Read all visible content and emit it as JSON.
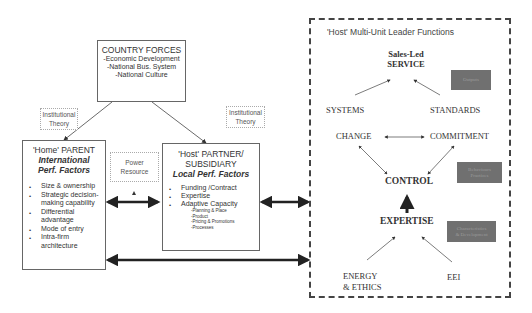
{
  "country_forces": {
    "title": "COUNTRY FORCES",
    "items": [
      "-Economic Development",
      "-National Bus. System",
      "-National Culture"
    ]
  },
  "institutional_theory_left": {
    "line1": "Institutional",
    "line2": "Theory"
  },
  "institutional_theory_right": {
    "line1": "Institutional",
    "line2": "Theory"
  },
  "power_resource": {
    "line1": "Power",
    "line2": "Resource"
  },
  "parent": {
    "title": "'Home' PARENT",
    "subtitle1": "International",
    "subtitle2": "Perf. Factors",
    "bullets": [
      "Size & ownership",
      "Strategic decision-making capability",
      "Differential advantage",
      "Mode of entry",
      "Intra-firm architecture"
    ]
  },
  "partner": {
    "title1": "'Host' PARTNER/",
    "title2": "SUBSIDIARY",
    "subtitle": "Local Perf. Factors",
    "bullets": [
      "Funding /Contract",
      "Expertise",
      "Adaptive Capacity"
    ],
    "sub_items": [
      "-Planning & Place",
      "-Product",
      "-Pricing & Promotions",
      "-Processes"
    ]
  },
  "host_functions": {
    "title": "'Host' Multi-Unit Leader Functions",
    "service_line1": "Sales-Led",
    "service_line2": "SERVICE",
    "systems": "SYSTEMS",
    "standards": "STANDARDS",
    "change": "CHANGE",
    "commitment": "COMMITMENT",
    "control": "CONTROL",
    "expertise": "EXPERTISE",
    "energy_line1": "ENERGY",
    "energy_line2": "& ETHICS",
    "eei": "EEI",
    "label_outputs": "Outputs",
    "label_behaviours_1": "Behaviours",
    "label_behaviours_2": "Practices",
    "label_characteristics_1": "Characteristics",
    "label_characteristics_2": "& Development"
  }
}
